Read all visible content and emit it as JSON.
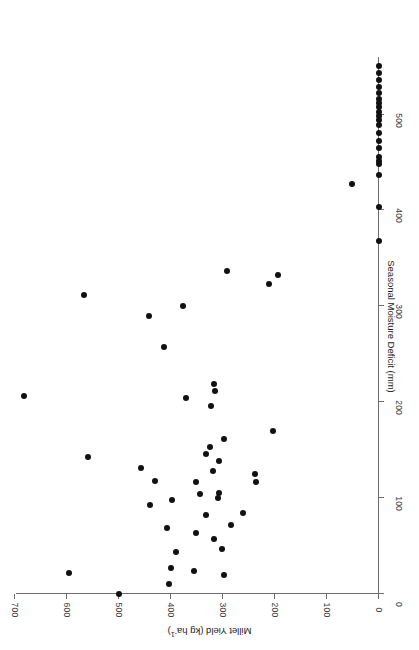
{
  "figure": {
    "rotation_degrees": 180,
    "background": "#ffffff",
    "point_color": "#111111",
    "axis_color": "#6e6e6e"
  },
  "chart_data": {
    "type": "scatter",
    "title": "",
    "xlabel": "Millet Yield (kg ha-1)",
    "xlabel_display": "Millet Yield (kg ha",
    "xlabel_sup": "-1",
    "xlabel_tail": ")",
    "ylabel": "Seasonal Moisture Deficit (mm)",
    "xlim": [
      0,
      730
    ],
    "ylim": [
      0,
      560
    ],
    "xticks": [
      0,
      100,
      200,
      300,
      400,
      500,
      600,
      700
    ],
    "yticks": [
      0,
      100,
      200,
      300,
      400,
      500
    ],
    "xtick_labels": [
      "0",
      "100",
      "200",
      "300",
      "400",
      "500",
      "600",
      "700"
    ],
    "ytick_labels": [
      "0",
      "100",
      "200",
      "300",
      "400",
      "500"
    ],
    "grid": false,
    "legend": null,
    "x_axis_direction": "right-to-left",
    "n_points": 62,
    "points": [
      {
        "x": 500,
        "y": 0
      },
      {
        "x": 403,
        "y": 10
      },
      {
        "x": 596,
        "y": 22
      },
      {
        "x": 400,
        "y": 27
      },
      {
        "x": 355,
        "y": 24
      },
      {
        "x": 298,
        "y": 20
      },
      {
        "x": 390,
        "y": 44
      },
      {
        "x": 302,
        "y": 47
      },
      {
        "x": 318,
        "y": 57
      },
      {
        "x": 408,
        "y": 69
      },
      {
        "x": 352,
        "y": 64
      },
      {
        "x": 285,
        "y": 72
      },
      {
        "x": 333,
        "y": 82
      },
      {
        "x": 262,
        "y": 84
      },
      {
        "x": 440,
        "y": 93
      },
      {
        "x": 398,
        "y": 98
      },
      {
        "x": 309,
        "y": 100
      },
      {
        "x": 308,
        "y": 105
      },
      {
        "x": 345,
        "y": 104
      },
      {
        "x": 430,
        "y": 118
      },
      {
        "x": 352,
        "y": 117
      },
      {
        "x": 236,
        "y": 117
      },
      {
        "x": 238,
        "y": 125
      },
      {
        "x": 457,
        "y": 131
      },
      {
        "x": 320,
        "y": 128
      },
      {
        "x": 307,
        "y": 139
      },
      {
        "x": 333,
        "y": 146
      },
      {
        "x": 325,
        "y": 153
      },
      {
        "x": 298,
        "y": 162
      },
      {
        "x": 560,
        "y": 143
      },
      {
        "x": 204,
        "y": 170
      },
      {
        "x": 323,
        "y": 196
      },
      {
        "x": 372,
        "y": 204
      },
      {
        "x": 316,
        "y": 212
      },
      {
        "x": 682,
        "y": 207
      },
      {
        "x": 317,
        "y": 219
      },
      {
        "x": 414,
        "y": 258
      },
      {
        "x": 443,
        "y": 290
      },
      {
        "x": 568,
        "y": 312
      },
      {
        "x": 377,
        "y": 300
      },
      {
        "x": 292,
        "y": 337
      },
      {
        "x": 195,
        "y": 333
      },
      {
        "x": 212,
        "y": 323
      },
      {
        "x": 0,
        "y": 368
      },
      {
        "x": 0,
        "y": 404
      },
      {
        "x": 52,
        "y": 428
      },
      {
        "x": 0,
        "y": 437
      },
      {
        "x": 0,
        "y": 448
      },
      {
        "x": 0,
        "y": 452
      },
      {
        "x": 0,
        "y": 456
      },
      {
        "x": 0,
        "y": 465
      },
      {
        "x": 0,
        "y": 472
      },
      {
        "x": 0,
        "y": 481
      },
      {
        "x": 0,
        "y": 489
      },
      {
        "x": 0,
        "y": 494
      },
      {
        "x": 0,
        "y": 498
      },
      {
        "x": 0,
        "y": 503
      },
      {
        "x": 0,
        "y": 508
      },
      {
        "x": 0,
        "y": 512
      },
      {
        "x": 0,
        "y": 516
      },
      {
        "x": 0,
        "y": 522
      },
      {
        "x": 0,
        "y": 529
      },
      {
        "x": 0,
        "y": 536
      },
      {
        "x": 0,
        "y": 543
      },
      {
        "x": 0,
        "y": 551
      }
    ]
  }
}
